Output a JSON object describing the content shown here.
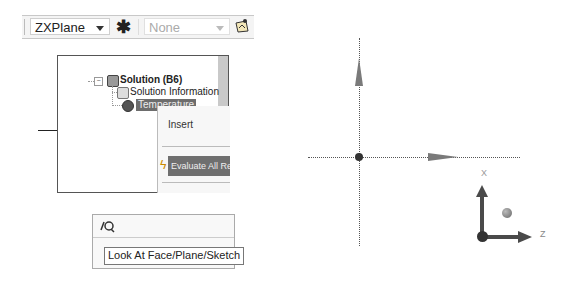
{
  "toolbar": {
    "plane_select": "ZXPlane",
    "sketch_select": "None",
    "icons": [
      "new-sketch-asterisk-icon",
      "sketch-plane-icon"
    ]
  },
  "tree": {
    "expander": "−",
    "items": [
      {
        "label": "Solution (B6)",
        "icon": "solution-icon"
      },
      {
        "label": "Solution Information",
        "icon": "info-icon"
      },
      {
        "label": "Temperature",
        "icon": "temperature-icon",
        "selected": true
      }
    ]
  },
  "context_menu": {
    "items": [
      {
        "label": "Insert"
      },
      {
        "label": "Evaluate All Results",
        "icon": "lightning-icon",
        "highlighted": true
      }
    ],
    "bolt_glyph": "ϟ"
  },
  "look_at": {
    "icon_glyph": "⚲",
    "tooltip": "Look At Face/Plane/Sketch"
  },
  "viewport": {
    "triad": {
      "x_label": "X",
      "z_label": "Z"
    }
  }
}
